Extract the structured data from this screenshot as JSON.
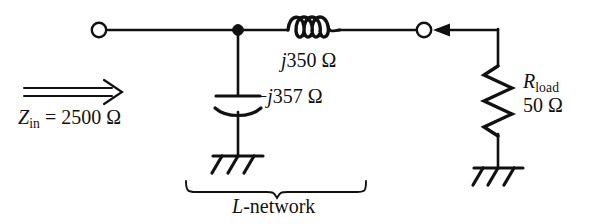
{
  "figure": {
    "name": "L-network impedance matching circuit",
    "stroke_color": "#111111",
    "background_color": "#ffffff"
  },
  "labels": {
    "inductor_value": "j350 Ω",
    "inductor_value_parts": {
      "j": "j",
      "number": "350",
      "unit": "Ω"
    },
    "capacitor_value": "−j357 Ω",
    "capacitor_value_parts": {
      "sign": "−",
      "j": "j",
      "number": "357",
      "unit": "Ω"
    },
    "input_impedance": "Zᵢₙ = 2500 Ω",
    "input_impedance_parts": {
      "symbol": "Z",
      "subscript": "in",
      "equals": "=",
      "number": "2500",
      "unit": "Ω"
    },
    "load_resistor": "R load",
    "load_resistor_parts": {
      "symbol": "R",
      "subscript": "load"
    },
    "load_resistor_value": "50 Ω",
    "load_resistor_value_parts": {
      "number": "50",
      "unit": "Ω"
    },
    "network_caption": "L-network",
    "network_caption_parts": {
      "symbol": "L",
      "rest": "-network"
    }
  },
  "components": [
    {
      "id": "inductor",
      "type": "inductor",
      "turns": 4,
      "value": "j350 Ω",
      "orientation": "horizontal"
    },
    {
      "id": "capacitor",
      "type": "capacitor",
      "style": "curved-plate",
      "value": "−j357 Ω",
      "orientation": "vertical"
    },
    {
      "id": "resistor",
      "type": "resistor",
      "style": "zigzag",
      "value": "50 Ω",
      "orientation": "vertical"
    },
    {
      "id": "ground-left",
      "type": "ground",
      "style": "rake",
      "legs": 3
    },
    {
      "id": "ground-right",
      "type": "ground",
      "style": "rake",
      "legs": 3
    },
    {
      "id": "terminal-left",
      "type": "open-terminal"
    },
    {
      "id": "terminal-right",
      "type": "open-terminal"
    },
    {
      "id": "junction",
      "type": "node-dot"
    },
    {
      "id": "zin-arrow",
      "type": "double-line-arrow",
      "direction": "right"
    },
    {
      "id": "load-arrow",
      "type": "arrow",
      "direction": "left"
    },
    {
      "id": "network-brace",
      "type": "curly-brace",
      "direction": "down"
    }
  ]
}
